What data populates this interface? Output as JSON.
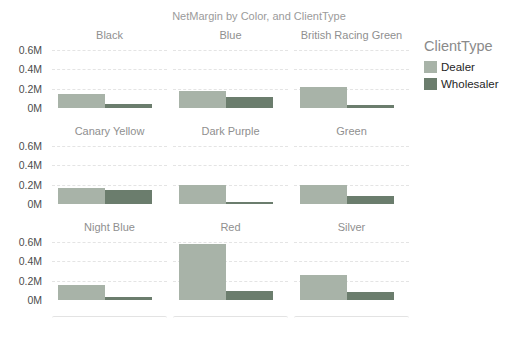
{
  "chart": {
    "title": "NetMargin by Color, and ClientType",
    "legend": {
      "title": "ClientType",
      "items": [
        {
          "label": "Dealer",
          "color": "#a8b3a8"
        },
        {
          "label": "Wholesaler",
          "color": "#6b7d6d"
        }
      ]
    },
    "colors": {
      "dealer": "#a8b3a8",
      "wholesaler": "#6b7d6d",
      "gridline": "#e4e4e4",
      "tick_label": "#4d4d4d",
      "panel_title": "#8f8f8f",
      "chart_title": "#9b9b9b"
    }
  },
  "chart_data": {
    "type": "bar",
    "small_multiples": true,
    "title": "NetMargin by Color, and ClientType",
    "legend_title": "ClientType",
    "legend_position": "right",
    "grid": "dashed-horizontal",
    "value_unit": "M",
    "ylim": [
      0,
      0.6
    ],
    "y_ticks": [
      "0.6M",
      "0.4M",
      "0.2M",
      "0M"
    ],
    "panels": [
      "Black",
      "Blue",
      "British Racing Green",
      "Canary Yellow",
      "Dark Purple",
      "Green",
      "Night Blue",
      "Red",
      "Silver"
    ],
    "series": [
      {
        "name": "Dealer",
        "color": "#a8b3a8",
        "values": [
          0.14,
          0.18,
          0.22,
          0.17,
          0.2,
          0.2,
          0.15,
          0.58,
          0.26
        ]
      },
      {
        "name": "Wholesaler",
        "color": "#6b7d6d",
        "values": [
          0.04,
          0.11,
          0.03,
          0.14,
          0.02,
          0.08,
          0.03,
          0.09,
          0.08
        ]
      }
    ]
  }
}
